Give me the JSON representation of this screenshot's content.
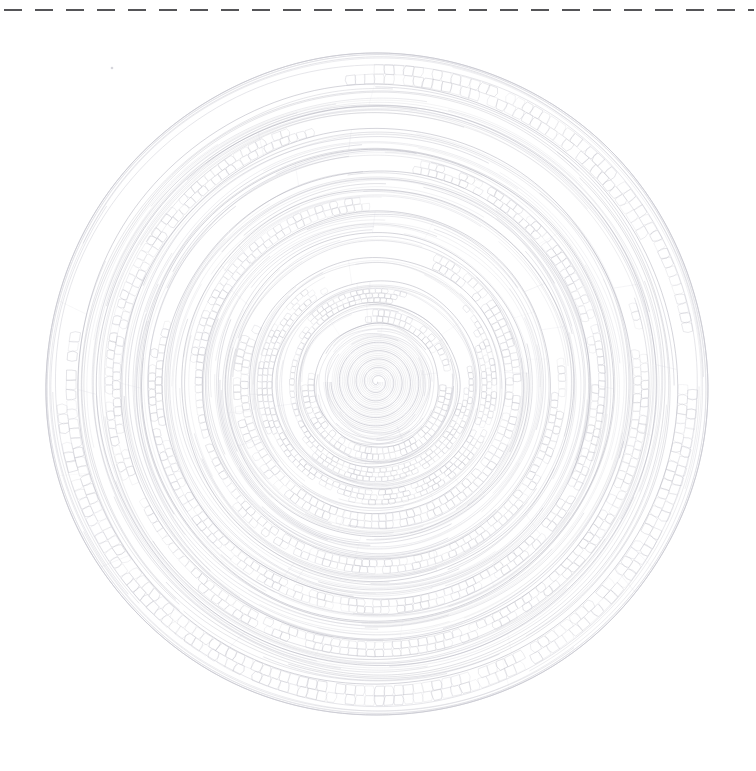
{
  "document": {
    "title": "Wood Cross-Section",
    "background_color": "#ffffff",
    "width": 756,
    "height": 771
  },
  "guide": {
    "name": "cut-line",
    "orientation": "horizontal",
    "y": 10,
    "x_start": 4,
    "x_end": 754,
    "dash_length": 18,
    "gap_length": 13,
    "color": "#555558",
    "stroke_width": 2.1
  },
  "specimen": {
    "shape": "circle",
    "center_x": 377,
    "center_y": 385,
    "radius": 331,
    "bounds": {
      "left": 46,
      "top": 54,
      "right": 708,
      "bottom": 716
    },
    "outline_color": "#c9c9d1",
    "line_color": "#bcbcc6",
    "faint_line_color": "#d5d5dd",
    "dark_line_color": "#a8a8b4"
  },
  "pith": {
    "name": "pith-spiral",
    "center_x": 377,
    "center_y": 382,
    "turns": 5.5,
    "max_radius": 46,
    "color": "#b2b2be"
  },
  "growth_rings": [
    {
      "index": 1,
      "inner_radius": 46,
      "outer_radius": 62,
      "earlywood_cells": false,
      "latewood_arcs": 5,
      "cell_size": 0
    },
    {
      "index": 2,
      "inner_radius": 62,
      "outer_radius": 82,
      "earlywood_cells": true,
      "latewood_arcs": 5,
      "cell_size": 5.0
    },
    {
      "index": 3,
      "inner_radius": 82,
      "outer_radius": 104,
      "earlywood_cells": true,
      "latewood_arcs": 6,
      "cell_size": 5.4
    },
    {
      "index": 4,
      "inner_radius": 104,
      "outer_radius": 128,
      "earlywood_cells": true,
      "latewood_arcs": 6,
      "cell_size": 5.8
    },
    {
      "index": 5,
      "inner_radius": 128,
      "outer_radius": 152,
      "earlywood_cells": true,
      "latewood_arcs": 7,
      "cell_size": 6.2
    },
    {
      "index": 6,
      "inner_radius": 152,
      "outer_radius": 174,
      "earlywood_cells": false,
      "latewood_arcs": 9,
      "cell_size": 0
    },
    {
      "index": 7,
      "inner_radius": 174,
      "outer_radius": 196,
      "earlywood_cells": true,
      "latewood_arcs": 6,
      "cell_size": 6.6
    },
    {
      "index": 8,
      "inner_radius": 196,
      "outer_radius": 214,
      "earlywood_cells": false,
      "latewood_arcs": 8,
      "cell_size": 0
    },
    {
      "index": 9,
      "inner_radius": 214,
      "outer_radius": 236,
      "earlywood_cells": true,
      "latewood_arcs": 6,
      "cell_size": 7.0
    },
    {
      "index": 10,
      "inner_radius": 236,
      "outer_radius": 256,
      "earlywood_cells": false,
      "latewood_arcs": 9,
      "cell_size": 0
    },
    {
      "index": 11,
      "inner_radius": 256,
      "outer_radius": 280,
      "earlywood_cells": true,
      "latewood_arcs": 6,
      "cell_size": 7.6
    },
    {
      "index": 12,
      "inner_radius": 280,
      "outer_radius": 300,
      "earlywood_cells": false,
      "latewood_arcs": 8,
      "cell_size": 0
    },
    {
      "index": 13,
      "inner_radius": 300,
      "outer_radius": 331,
      "earlywood_cells": true,
      "latewood_arcs": 5,
      "cell_size": 8.4
    }
  ],
  "rendering": {
    "arc_stroke_width": 0.55,
    "cell_stroke_width": 0.5,
    "outline_stroke_width": 0.8,
    "arc_gap_count_variation": 2
  },
  "artifacts": [
    {
      "name": "dust-speck",
      "x": 112,
      "y": 68,
      "radius": 1.3
    }
  ]
}
